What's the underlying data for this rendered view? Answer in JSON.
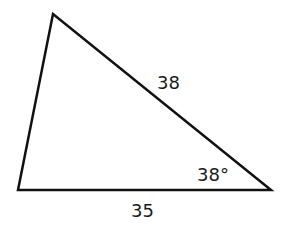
{
  "diagram": {
    "type": "triangle",
    "vertices": {
      "top": [
        53,
        14
      ],
      "bottom_left": [
        18,
        190
      ],
      "bottom_right": [
        271,
        190
      ]
    },
    "labels": {
      "hypotenuse_side": "38",
      "angle": "38°",
      "base_side": "35"
    },
    "stroke_color": "#111111"
  }
}
